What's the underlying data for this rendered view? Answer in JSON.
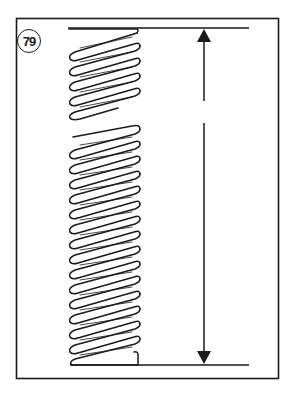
{
  "figure": {
    "number_label": "79",
    "colors": {
      "ink": "#1a1a1a",
      "background": "#ffffff"
    },
    "spring": {
      "upper_segment_coils": 6,
      "lower_segment_coils": 16,
      "break_between_segments": true
    },
    "dimension": {
      "type": "vertical-double-arrow",
      "measures": "spring free length"
    }
  }
}
